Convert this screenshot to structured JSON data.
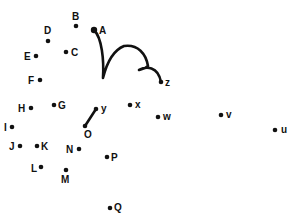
{
  "puzzle": {
    "type": "connect-the-dots",
    "ink_color": "#111111",
    "background": "#ffffff",
    "dots": [
      {
        "label": "A",
        "x": 94,
        "y": 30,
        "lx": 99,
        "ly": 34,
        "r": 3.2
      },
      {
        "label": "B",
        "x": 76,
        "y": 26,
        "lx": 72,
        "ly": 20,
        "r": 2.3
      },
      {
        "label": "C",
        "x": 66,
        "y": 52,
        "lx": 71,
        "ly": 56,
        "r": 2.3
      },
      {
        "label": "D",
        "x": 48,
        "y": 41,
        "lx": 44,
        "ly": 34,
        "r": 2.3
      },
      {
        "label": "E",
        "x": 36,
        "y": 56,
        "lx": 24,
        "ly": 60,
        "r": 2.3
      },
      {
        "label": "F",
        "x": 40,
        "y": 80,
        "lx": 28,
        "ly": 84,
        "r": 2.3
      },
      {
        "label": "G",
        "x": 54,
        "y": 105,
        "lx": 58,
        "ly": 109,
        "r": 2.3
      },
      {
        "label": "H",
        "x": 31,
        "y": 108,
        "lx": 18,
        "ly": 112,
        "r": 2.3
      },
      {
        "label": "I",
        "x": 12,
        "y": 127,
        "lx": 4,
        "ly": 131,
        "r": 2.3
      },
      {
        "label": "J",
        "x": 20,
        "y": 146,
        "lx": 9,
        "ly": 150,
        "r": 2.3
      },
      {
        "label": "K",
        "x": 37,
        "y": 146,
        "lx": 41,
        "ly": 150,
        "r": 2.3
      },
      {
        "label": "L",
        "x": 41,
        "y": 167,
        "lx": 31,
        "ly": 172,
        "r": 2.3
      },
      {
        "label": "M",
        "x": 66,
        "y": 170,
        "lx": 61,
        "ly": 183,
        "r": 2.3
      },
      {
        "label": "N",
        "x": 79,
        "y": 149,
        "lx": 66,
        "ly": 153,
        "r": 2.3
      },
      {
        "label": "O",
        "x": 85,
        "y": 126,
        "lx": 84,
        "ly": 138,
        "r": 2.3
      },
      {
        "label": "P",
        "x": 107,
        "y": 157,
        "lx": 111,
        "ly": 161,
        "r": 2.3
      },
      {
        "label": "Q",
        "x": 110,
        "y": 208,
        "lx": 114,
        "ly": 211,
        "r": 2.3
      },
      {
        "label": "x",
        "x": 130,
        "y": 105,
        "lx": 135,
        "ly": 108,
        "r": 2.3
      },
      {
        "label": "y",
        "x": 96,
        "y": 109,
        "lx": 101,
        "ly": 112,
        "r": 2.3
      },
      {
        "label": "w",
        "x": 158,
        "y": 117,
        "lx": 163,
        "ly": 120,
        "r": 2.3
      },
      {
        "label": "v",
        "x": 221,
        "y": 115,
        "lx": 226,
        "ly": 118,
        "r": 2.3
      },
      {
        "label": "u",
        "x": 275,
        "y": 130,
        "lx": 281,
        "ly": 133,
        "r": 2.3
      },
      {
        "label": "z",
        "x": 161,
        "y": 82,
        "lx": 165,
        "ly": 86,
        "r": 2.3
      }
    ],
    "drawn_lines": [
      {
        "from": "A",
        "to": "z",
        "kind": "curve",
        "path": "M94,30 C102,38 104,60 103,78 C107,62 114,50 124,46 C138,44 146,54 148,66 C144,70 140,69 139,70 C146,66 158,66 161,82"
      },
      {
        "from": "y",
        "to": "O",
        "kind": "straight",
        "path": "M96,109 L85,126"
      }
    ]
  }
}
